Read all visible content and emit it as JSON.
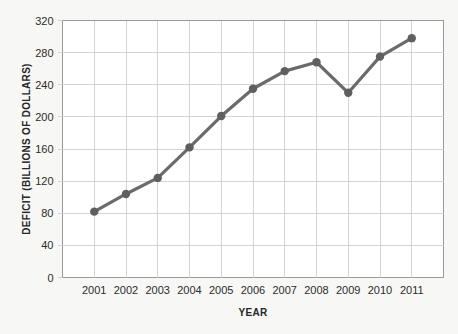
{
  "chart_data": {
    "type": "line",
    "title": "",
    "xlabel": "YEAR",
    "ylabel": "DEFICIT (BILLIONS OF DOLLARS)",
    "categories": [
      "2001",
      "2002",
      "2003",
      "2004",
      "2005",
      "2006",
      "2007",
      "2008",
      "2009",
      "2010",
      "2011"
    ],
    "x": [
      2001,
      2002,
      2003,
      2004,
      2005,
      2006,
      2007,
      2008,
      2009,
      2010,
      2011
    ],
    "values": [
      82,
      104,
      124,
      162,
      201,
      235,
      257,
      268,
      230,
      275,
      298
    ],
    "series": [
      {
        "name": "Deficit",
        "values": [
          82,
          104,
          124,
          162,
          201,
          235,
          257,
          268,
          230,
          275,
          298
        ]
      }
    ],
    "ylim": [
      0,
      320
    ],
    "ytick_labels": [
      "0",
      "40",
      "80",
      "120",
      "160",
      "200",
      "240",
      "280",
      "320"
    ],
    "yticks": [
      0,
      40,
      80,
      120,
      160,
      200,
      240,
      280,
      320
    ],
    "xtick_labels": [
      "2001",
      "2002",
      "2003",
      "2004",
      "2005",
      "2006",
      "2007",
      "2008",
      "2009",
      "2010",
      "2011"
    ],
    "grid": true,
    "legend": false,
    "legend_position": "none",
    "line_color": "#6b6b6b",
    "marker_color": "#5f5f5f",
    "gridline_color": "#c9c9c9",
    "plot_background": "#ffffff",
    "page_background": "#f7f7f5",
    "text_color": "#262626"
  }
}
